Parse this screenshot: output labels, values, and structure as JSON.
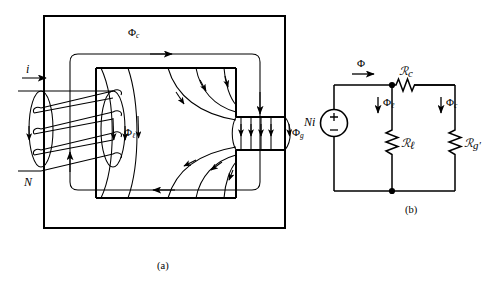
{
  "figure": {
    "background_color": "#ffffff",
    "line_color": "#000000",
    "panels": [
      {
        "id": "a",
        "caption": "(a)",
        "description": "Magnetic core with N-turn coil, leakage flux and air gap"
      },
      {
        "id": "b",
        "caption": "(b)",
        "description": "Magnetic equivalent (reluctance) circuit"
      }
    ]
  },
  "panel_a": {
    "caption": "(a)",
    "labels": {
      "current": "i",
      "turns": "N",
      "core_flux": "Φ",
      "core_flux_sub": "c",
      "leakage_flux": "Φ",
      "leakage_flux_sub": "ℓ",
      "gap_flux": "Φ",
      "gap_flux_sub": "g"
    },
    "coil": {
      "turns_drawn": 4,
      "lead_in_label": "i",
      "lead_out_label": "N"
    },
    "geometry": {
      "outer_core": {
        "x": 44,
        "y": 16,
        "width": 241,
        "height": 212
      },
      "inner_window": {
        "x": 96,
        "y": 68,
        "width": 140,
        "height": 130
      },
      "air_gap": {
        "x": 236,
        "y": 117,
        "width": 49,
        "height": 33
      }
    }
  },
  "panel_b": {
    "caption": "(b)",
    "source": {
      "name": "mmf-source",
      "label": "Ni",
      "polarity_top": "+",
      "polarity_bottom": "−"
    },
    "branches": [
      {
        "name": "total-flux",
        "flux_symbol": "Φ",
        "flux_sub": "",
        "arrow_direction": "right"
      },
      {
        "name": "leakage-branch",
        "flux_symbol": "Φ",
        "flux_sub": "ℓ",
        "arrow_direction": "down",
        "element_symbol": "ℛ",
        "element_sub": "ℓ",
        "element_prime": ""
      },
      {
        "name": "core-series-element",
        "element_symbol": "ℛ",
        "element_sub": "c",
        "element_prime": "",
        "orientation": "horizontal"
      },
      {
        "name": "gap-branch",
        "flux_symbol": "Φ",
        "flux_sub": "c",
        "arrow_direction": "down",
        "element_symbol": "ℛ",
        "element_sub": "g",
        "element_prime": "′"
      }
    ],
    "geometry": {
      "left_rail_x": 334,
      "mid_rail_x": 392,
      "right_rail_x": 455,
      "top_rail_y": 85,
      "bottom_rail_y": 191
    }
  }
}
